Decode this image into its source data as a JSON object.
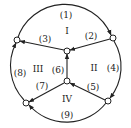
{
  "diagram": {
    "type": "directed-graph",
    "nodes": [
      {
        "id": "A",
        "x": 17,
        "y": 40
      },
      {
        "id": "B",
        "x": 113,
        "y": 38
      },
      {
        "id": "C",
        "x": 67,
        "y": 51
      },
      {
        "id": "D",
        "x": 67,
        "y": 81
      },
      {
        "id": "E",
        "x": 26,
        "y": 103
      },
      {
        "id": "F",
        "x": 108,
        "y": 101
      }
    ],
    "edges": [
      {
        "label": "(1)",
        "from": "A",
        "to": "B",
        "kind": "arc"
      },
      {
        "label": "(2)",
        "from": "B",
        "to": "C",
        "kind": "line"
      },
      {
        "label": "(3)",
        "from": "C",
        "to": "A",
        "kind": "line"
      },
      {
        "label": "(4)",
        "from": "B",
        "to": "F",
        "kind": "arc"
      },
      {
        "label": "(5)",
        "from": "F",
        "to": "D",
        "kind": "line"
      },
      {
        "label": "(6)",
        "from": "D",
        "to": "C",
        "kind": "line"
      },
      {
        "label": "(7)",
        "from": "D",
        "to": "E",
        "kind": "line"
      },
      {
        "label": "(8)",
        "from": "E",
        "to": "A",
        "kind": "arc"
      },
      {
        "label": "(9)",
        "from": "F",
        "to": "E",
        "kind": "arc"
      }
    ],
    "regions": [
      {
        "label": "I"
      },
      {
        "label": "II"
      },
      {
        "label": "III"
      },
      {
        "label": "IV"
      }
    ],
    "colors": {
      "stroke": "#222222",
      "node_fill": "#ffffff"
    }
  }
}
